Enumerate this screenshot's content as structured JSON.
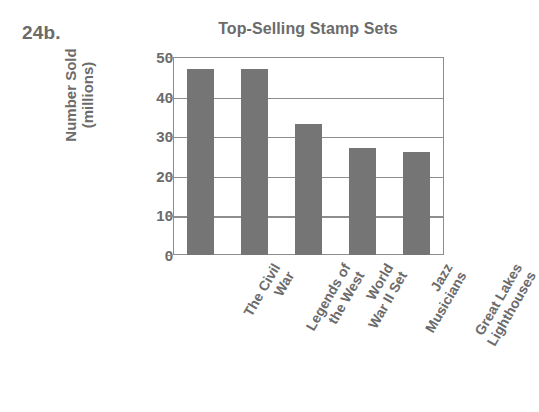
{
  "problem_number": "24b.",
  "chart_data": {
    "type": "bar",
    "title": "Top-Selling Stamp Sets",
    "xlabel": "",
    "ylabel": "Number Sold (millions)",
    "ylabel_lines": [
      "Number Sold",
      "(millions)"
    ],
    "categories": [
      "The Civil War",
      "Legends of the West",
      "World War II Set",
      "Jazz Musicians",
      "Great Lakes Lighthouses"
    ],
    "category_lines": [
      [
        "The Civil",
        "War"
      ],
      [
        "Legends of",
        "the West"
      ],
      [
        "World",
        "War II Set"
      ],
      [
        "Jazz",
        "Musicians"
      ],
      [
        "Great Lakes",
        "Lighthouses"
      ]
    ],
    "values": [
      47,
      47,
      33,
      27,
      26
    ],
    "ylim": [
      0,
      50
    ],
    "ytick_values": [
      0,
      10,
      20,
      30,
      40,
      50
    ],
    "ytick_labels": [
      "0",
      "10",
      "20",
      "30",
      "40",
      "50"
    ],
    "grid": true,
    "legend": false,
    "bar_color": "#757575",
    "axis_color": "#8d8d8d",
    "text_color": "#6b6b6b"
  }
}
